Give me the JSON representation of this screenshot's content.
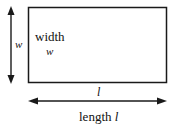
{
  "diagram": {
    "rectangle": {
      "inner_label": "width",
      "inner_variable": "w"
    },
    "vertical_dimension": {
      "label": "w"
    },
    "horizontal_dimension": {
      "variable": "l",
      "caption_word": "length",
      "caption_variable": "l"
    },
    "colors": {
      "stroke": "#1a1a1a",
      "background": "#ffffff"
    }
  }
}
